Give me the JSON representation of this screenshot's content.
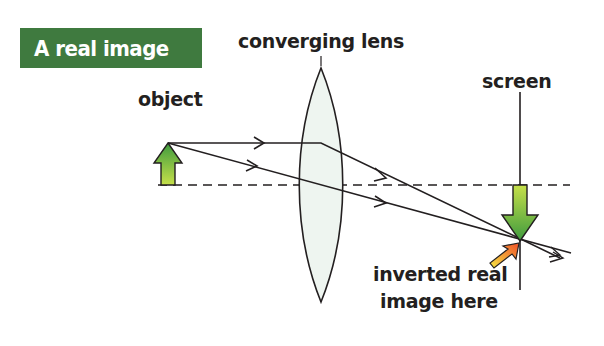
{
  "title": "A real image",
  "labels": {
    "lens": "converging lens",
    "object": "object",
    "screen": "screen",
    "image_line1": "inverted real",
    "image_line2": "image here"
  },
  "colors": {
    "title_bg": "#3f7a3f",
    "title_text": "#ffffff",
    "arrow_green_dark": "#3e9a3e",
    "arrow_green_light": "#c6e04a",
    "pointer_orange": "#f0502a",
    "pointer_yellow": "#f5e642",
    "lens_fill": "#eef5f0",
    "line": "#231f20"
  }
}
